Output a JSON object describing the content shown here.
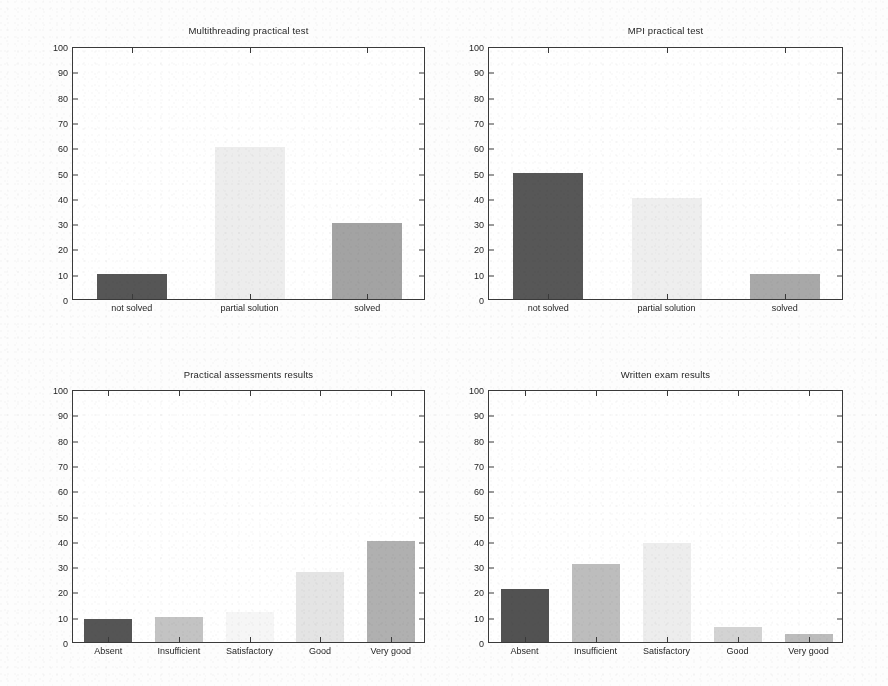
{
  "figure": {
    "width": 888,
    "height": 686,
    "background": "#fdfdfd",
    "panel_count": 4,
    "axis_color": "#3a3a3a",
    "text_color": "#1f1f1f"
  },
  "chart_data": [
    {
      "id": "multithreading-practical-test",
      "type": "bar",
      "title": "Multithreading practical test",
      "xlabel": "",
      "ylabel": "",
      "ylim": [
        0,
        100
      ],
      "yticks": [
        0,
        10,
        20,
        30,
        40,
        50,
        60,
        70,
        80,
        90,
        100
      ],
      "ytick_labels": [
        "0",
        "10",
        "20",
        "30",
        "40",
        "50",
        "60",
        "70",
        "80",
        "90",
        "100"
      ],
      "grid": false,
      "legend": null,
      "categories": [
        "not solved",
        "partial solution",
        "solved"
      ],
      "values": [
        10,
        60,
        30
      ],
      "bar_colors": [
        "#565656",
        "#ededed",
        "#a3a3a3"
      ],
      "panel": {
        "left": 72,
        "top": 47,
        "right": 425,
        "bottom": 300,
        "title_y": 25
      }
    },
    {
      "id": "mpi-practical-test",
      "type": "bar",
      "title": "MPI practical test",
      "xlabel": "",
      "ylabel": "",
      "ylim": [
        0,
        100
      ],
      "yticks": [
        0,
        10,
        20,
        30,
        40,
        50,
        60,
        70,
        80,
        90,
        100
      ],
      "ytick_labels": [
        "0",
        "10",
        "20",
        "30",
        "40",
        "50",
        "60",
        "70",
        "80",
        "90",
        "100"
      ],
      "grid": false,
      "legend": null,
      "categories": [
        "not solved",
        "partial solution",
        "solved"
      ],
      "values": [
        50,
        40,
        10
      ],
      "bar_colors": [
        "#575757",
        "#eeeeee",
        "#a8a8a8"
      ],
      "panel": {
        "left": 488,
        "top": 47,
        "right": 843,
        "bottom": 300,
        "title_y": 25
      }
    },
    {
      "id": "practical-assessments-results",
      "type": "bar",
      "title": "Practical assessments results",
      "xlabel": "",
      "ylabel": "",
      "ylim": [
        0,
        100
      ],
      "yticks": [
        0,
        10,
        20,
        30,
        40,
        50,
        60,
        70,
        80,
        90,
        100
      ],
      "ytick_labels": [
        "0",
        "10",
        "20",
        "30",
        "40",
        "50",
        "60",
        "70",
        "80",
        "90",
        "100"
      ],
      "grid": false,
      "legend": null,
      "categories": [
        "Absent",
        "Insufficient",
        "Satisfactory",
        "Good",
        "Very good"
      ],
      "values": [
        9,
        10,
        12,
        27.5,
        40
      ],
      "bar_colors": [
        "#555555",
        "#c3c3c3",
        "#f6f6f6",
        "#e4e4e4",
        "#b0b0b0"
      ],
      "panel": {
        "left": 72,
        "top": 390,
        "right": 425,
        "bottom": 643,
        "title_y": 369
      }
    },
    {
      "id": "written-exam-results",
      "type": "bar",
      "title": "Written exam results",
      "xlabel": "",
      "ylabel": "",
      "ylim": [
        0,
        100
      ],
      "yticks": [
        0,
        10,
        20,
        30,
        40,
        50,
        60,
        70,
        80,
        90,
        100
      ],
      "ytick_labels": [
        "0",
        "10",
        "20",
        "30",
        "40",
        "50",
        "60",
        "70",
        "80",
        "90",
        "100"
      ],
      "grid": false,
      "legend": null,
      "categories": [
        "Absent",
        "Insufficient",
        "Satisfactory",
        "Good",
        "Very good"
      ],
      "values": [
        21,
        31,
        39,
        6,
        3
      ],
      "bar_colors": [
        "#525252",
        "#bdbdbd",
        "#ededed",
        "#d3d3d3",
        "#bcbcbc"
      ],
      "panel": {
        "left": 488,
        "top": 390,
        "right": 843,
        "bottom": 643,
        "title_y": 369
      }
    }
  ]
}
